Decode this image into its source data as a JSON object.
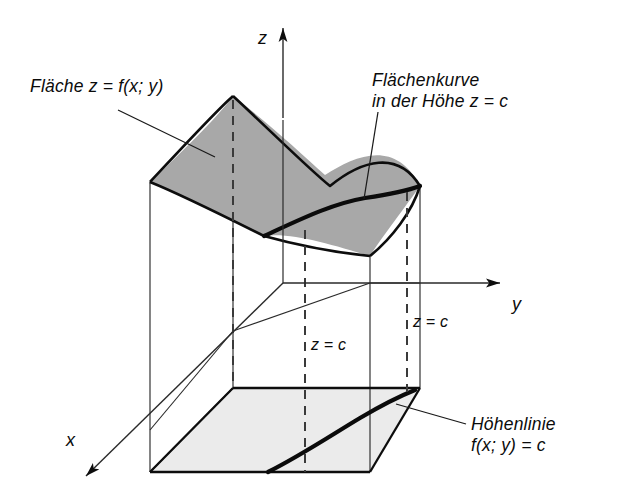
{
  "figure": {
    "kind": "3d-surface-level-curve-diagram",
    "background_color": "#ffffff",
    "line_color": "#111111",
    "surface_fill": "#a8a8a8",
    "floor_fill": "#ebebeb"
  },
  "annotations": {
    "surface": {
      "text": "Fläche z = f(x; y)",
      "leader_from": [
        118,
        110
      ],
      "leader_to": [
        215,
        157
      ]
    },
    "level_curve": {
      "line1": "Flächenkurve",
      "line2": "in der Höhe z = c",
      "leader_from": [
        378,
        110
      ],
      "leader_to": [
        365,
        198
      ]
    },
    "contour_line": {
      "line1": "Höhenlinie",
      "line2": "f(x; y) = c",
      "leader_from": [
        466,
        424
      ],
      "leader_to": [
        398,
        403
      ]
    }
  },
  "axes": {
    "z": {
      "label": "z",
      "direction": "up"
    },
    "y": {
      "label": "y",
      "direction": "right"
    },
    "x": {
      "label": "x",
      "direction": "down-left"
    }
  },
  "plane_labels": {
    "front": "z = c",
    "back": "z = c"
  }
}
